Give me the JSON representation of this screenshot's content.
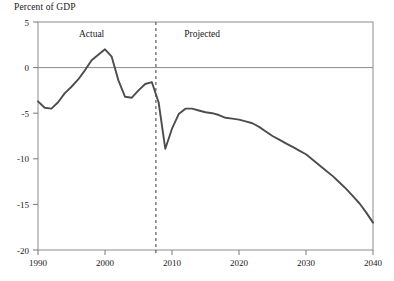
{
  "chart_data": {
    "type": "line",
    "title": "",
    "ylabel": "Percent of GDP",
    "xlabel": "",
    "ylim": [
      -20,
      5
    ],
    "xlim": [
      1990,
      2040
    ],
    "yticks": [
      5,
      0,
      -5,
      -10,
      -15,
      -20
    ],
    "ytick_labels": [
      "5",
      "0",
      "-5",
      "-10",
      "-15",
      "-20"
    ],
    "xticks": [
      1990,
      2000,
      2010,
      2020,
      2030,
      2040
    ],
    "xtick_labels": [
      "1990",
      "2000",
      "2010",
      "2020",
      "2030",
      "2040"
    ],
    "grid": false,
    "zero_line": true,
    "legend": null,
    "annotations": [
      {
        "text": "Actual",
        "x": 1998.0,
        "y": 3.4
      },
      {
        "text": "Projected",
        "x": 2014.5,
        "y": 3.4
      }
    ],
    "divider": {
      "x": 2007.6,
      "style": "dashed",
      "label_left": "Actual",
      "label_right": "Projected"
    },
    "line_color": "#4d4d4d",
    "series": [
      {
        "name": "Deficit as percent of GDP",
        "x": [
          1990,
          1991,
          1992,
          1993,
          1994,
          1995,
          1996,
          1997,
          1998,
          1999,
          2000,
          2001,
          2002,
          2003,
          2004,
          2005,
          2006,
          2007,
          2008,
          2009,
          2010,
          2011,
          2012,
          2013,
          2014,
          2015,
          2016,
          2017,
          2018,
          2019,
          2020,
          2021,
          2022,
          2023,
          2024,
          2025,
          2026,
          2027,
          2028,
          2029,
          2030,
          2031,
          2032,
          2033,
          2034,
          2035,
          2036,
          2037,
          2038,
          2039,
          2040
        ],
        "values": [
          -3.7,
          -4.4,
          -4.5,
          -3.8,
          -2.8,
          -2.1,
          -1.3,
          -0.3,
          0.8,
          1.4,
          2.0,
          1.2,
          -1.4,
          -3.2,
          -3.3,
          -2.5,
          -1.8,
          -1.6,
          -3.8,
          -8.9,
          -6.7,
          -5.1,
          -4.5,
          -4.5,
          -4.7,
          -4.9,
          -5.0,
          -5.2,
          -5.5,
          -5.6,
          -5.7,
          -5.9,
          -6.1,
          -6.5,
          -7.0,
          -7.5,
          -7.9,
          -8.3,
          -8.7,
          -9.1,
          -9.5,
          -10.1,
          -10.7,
          -11.3,
          -11.9,
          -12.6,
          -13.3,
          -14.1,
          -14.9,
          -15.9,
          -17.0
        ]
      }
    ]
  }
}
